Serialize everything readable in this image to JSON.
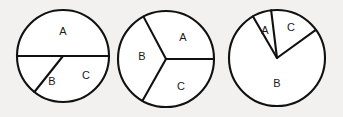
{
  "figure": {
    "background_color": "#f2f1ef",
    "stroke_color": "#111111",
    "fill_color": "#ffffff",
    "label_color": "#1a1a1a",
    "width": 343,
    "height": 117
  },
  "chart_data": [
    {
      "type": "pie",
      "name": "pie-chart-1",
      "title": "",
      "center": [
        63,
        56
      ],
      "radius": 46,
      "start_angle_deg": 0,
      "grid": false,
      "legend": "none",
      "labels_inside": true,
      "categories": [
        "A",
        "B",
        "C"
      ],
      "values": [
        50,
        36,
        14
      ],
      "angles_deg": [
        180,
        128.5,
        51.5
      ],
      "slices": [
        {
          "label": "A",
          "value": 50,
          "angle_deg": 180,
          "start_deg": 0,
          "end_deg": 180,
          "label_pos": [
            63,
            32
          ]
        },
        {
          "label": "B",
          "value": 36,
          "angle_deg": 128.5,
          "start_deg": 231.5,
          "end_deg": 360,
          "label_pos": [
            52,
            82
          ]
        },
        {
          "label": "C",
          "value": 14,
          "angle_deg": 51.5,
          "start_deg": 180,
          "end_deg": 231.5,
          "label_pos": [
            86,
            76
          ]
        }
      ]
    },
    {
      "type": "pie",
      "name": "pie-chart-2",
      "title": "",
      "center": [
        166,
        59
      ],
      "radius": 48,
      "start_angle_deg": 0,
      "grid": false,
      "legend": "none",
      "labels_inside": true,
      "categories": [
        "A",
        "B",
        "C"
      ],
      "values": [
        33,
        34,
        33
      ],
      "angles_deg": [
        118,
        122.7,
        119.3
      ],
      "slices": [
        {
          "label": "A",
          "value": 33,
          "angle_deg": 118,
          "start_deg": 0,
          "end_deg": 118,
          "label_pos": [
            183,
            38
          ]
        },
        {
          "label": "B",
          "value": 34,
          "angle_deg": 122.7,
          "start_deg": 118,
          "end_deg": 240.7,
          "label_pos": [
            142,
            57
          ]
        },
        {
          "label": "C",
          "value": 33,
          "angle_deg": 119.3,
          "start_deg": 240.7,
          "end_deg": 360,
          "label_pos": [
            181,
            87
          ]
        }
      ]
    },
    {
      "type": "pie",
      "name": "pie-chart-3",
      "title": "",
      "center": [
        277,
        58
      ],
      "radius": 48,
      "start_angle_deg": 0,
      "grid": false,
      "legend": "none",
      "labels_inside": true,
      "categories": [
        "A",
        "B",
        "C"
      ],
      "values": [
        6,
        77,
        17
      ],
      "angles_deg": [
        23,
        276,
        61
      ],
      "slices": [
        {
          "label": "A",
          "value": 6,
          "angle_deg": 23,
          "start_deg": 97,
          "end_deg": 120,
          "label_pos": [
            265,
            31
          ]
        },
        {
          "label": "B",
          "value": 77,
          "angle_deg": 276,
          "start_deg": 120,
          "end_deg": 396,
          "label_pos": [
            277,
            84
          ]
        },
        {
          "label": "C",
          "value": 17,
          "angle_deg": 61,
          "start_deg": 36,
          "end_deg": 97,
          "label_pos": [
            291,
            28
          ]
        }
      ]
    }
  ]
}
